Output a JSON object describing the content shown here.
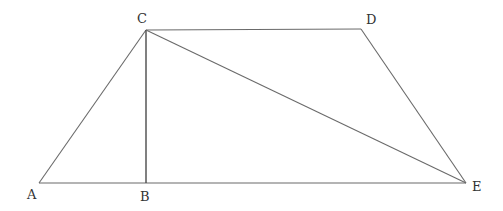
{
  "diagram": {
    "type": "geometry",
    "colors": {
      "background": "#ffffff",
      "line": "#6a6a6a",
      "label": "#333333"
    },
    "points": {
      "A": {
        "x": 39,
        "y": 183,
        "label": "A",
        "lx": 27,
        "ly": 199
      },
      "B": {
        "x": 146,
        "y": 183,
        "label": "B",
        "lx": 140,
        "ly": 201
      },
      "C": {
        "x": 146,
        "y": 30,
        "label": "C",
        "lx": 137,
        "ly": 23
      },
      "D": {
        "x": 361,
        "y": 29,
        "label": "D",
        "lx": 366,
        "ly": 24
      },
      "E": {
        "x": 466,
        "y": 183,
        "label": "E",
        "lx": 472,
        "ly": 191
      }
    },
    "segments": [
      {
        "name": "AB-BE-base",
        "from": "A",
        "to": "E"
      },
      {
        "name": "AC",
        "from": "A",
        "to": "C"
      },
      {
        "name": "CD",
        "from": "C",
        "to": "D"
      },
      {
        "name": "DE",
        "from": "D",
        "to": "E"
      },
      {
        "name": "CB",
        "from": "C",
        "to": "B"
      },
      {
        "name": "CE",
        "from": "C",
        "to": "E"
      }
    ],
    "labels": {
      "A": "A",
      "B": "B",
      "C": "C",
      "D": "D",
      "E": "E"
    }
  }
}
